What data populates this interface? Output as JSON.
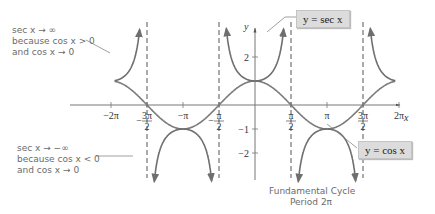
{
  "chart_data": {
    "type": "line",
    "title": "",
    "xlabel": "x",
    "ylabel": "y",
    "xlim": [
      -6.9,
      7.0
    ],
    "ylim": [
      -3.2,
      4.4
    ],
    "grid": false,
    "x_ticks": [
      "-2π",
      "-3π/2",
      "-π",
      "-π/2",
      "π/2",
      "π",
      "3π/2",
      "2π"
    ],
    "y_ticks": [
      "2",
      "-1",
      "-2"
    ],
    "series": [
      {
        "name": "y = sec x",
        "function": "sec(x)",
        "color": "#777777",
        "style": "solid",
        "arrows": true
      },
      {
        "name": "y = cos x",
        "function": "cos(x)",
        "color": "#777777",
        "style": "solid"
      }
    ],
    "asymptotes": [
      "-3π/2",
      "-π/2",
      "π/2",
      "3π/2"
    ],
    "legend": [
      "y = sec x",
      "y = cos x"
    ],
    "annotations": [
      "sec x → ∞ because cos x > 0 and cos x → 0",
      "sec x → −∞ because cos x < 0 and cos x → 0",
      "Fundamental Cycle Period 2π"
    ]
  },
  "labels": {
    "sec_label": "y = sec x",
    "cos_label": "y = cos x",
    "x_axis": "x",
    "y_axis": "y",
    "annot_top": [
      "sec x → ∞",
      "because cos x > 0",
      "and cos x → 0"
    ],
    "annot_bottom": [
      "sec x → −∞",
      "because cos x < 0",
      "and cos x → 0"
    ],
    "fundamental": [
      "Fundamental Cycle",
      "Period 2π"
    ]
  },
  "ticks": {
    "x": [
      {
        "label": "−2π"
      },
      {
        "num": "3π",
        "den": "2",
        "neg": true
      },
      {
        "label": "−π"
      },
      {
        "num": "π",
        "den": "2",
        "neg": true
      },
      {
        "num": "π",
        "den": "2",
        "neg": false
      },
      {
        "label": "π"
      },
      {
        "num": "3π",
        "den": "2",
        "neg": false
      },
      {
        "label": "2π"
      }
    ],
    "y": [
      "2",
      "−1",
      "−2"
    ]
  }
}
